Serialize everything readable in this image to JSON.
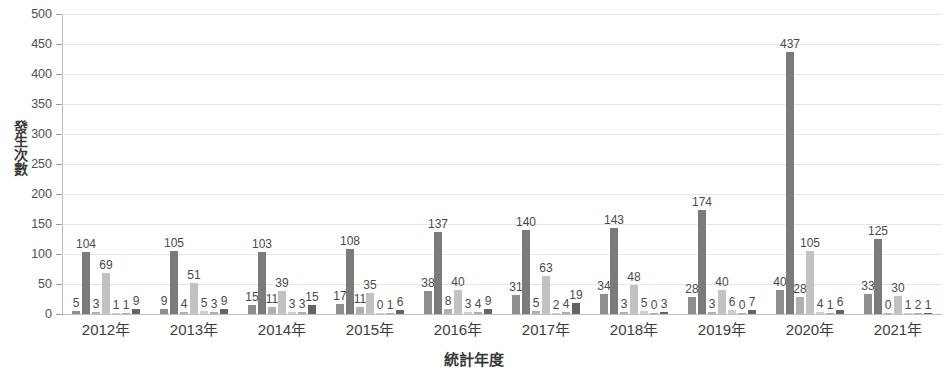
{
  "chart_data": {
    "type": "bar",
    "title": "",
    "xlabel": "統計年度",
    "ylabel": "發生次數",
    "ylim": [
      0,
      500
    ],
    "ytick_interval": 50,
    "yticks": [
      "0",
      "50",
      "100",
      "150",
      "200",
      "250",
      "300",
      "350",
      "400",
      "450",
      "500"
    ],
    "grid": true,
    "legend": "none",
    "categories": [
      "2012年",
      "2013年",
      "2014年",
      "2015年",
      "2016年",
      "2017年",
      "2018年",
      "2019年",
      "2020年",
      "2021年"
    ],
    "series": [
      {
        "name": "series-1",
        "color": "#8e8e8e",
        "values": [
          5,
          9,
          15,
          17,
          38,
          31,
          34,
          28,
          40,
          33
        ]
      },
      {
        "name": "series-2",
        "color": "#7b7b7b",
        "values": [
          104,
          105,
          103,
          108,
          137,
          140,
          143,
          174,
          437,
          125
        ]
      },
      {
        "name": "series-3",
        "color": "#b0b0b0",
        "values": [
          3,
          4,
          11,
          11,
          8,
          5,
          3,
          3,
          28,
          0
        ]
      },
      {
        "name": "series-4",
        "color": "#c2c2c2",
        "values": [
          69,
          51,
          39,
          35,
          40,
          63,
          48,
          40,
          105,
          30
        ]
      },
      {
        "name": "series-5",
        "color": "#d0d0d0",
        "values": [
          1,
          5,
          3,
          0,
          3,
          2,
          5,
          6,
          4,
          1
        ]
      },
      {
        "name": "series-6",
        "color": "#aeaeae",
        "values": [
          1,
          3,
          3,
          1,
          4,
          4,
          0,
          0,
          1,
          2
        ]
      },
      {
        "name": "series-7",
        "color": "#636363",
        "values": [
          9,
          9,
          15,
          6,
          9,
          19,
          3,
          7,
          6,
          1
        ]
      }
    ]
  },
  "colors": {
    "gridline": "#e6e6e6",
    "axis": "#bdbdbd",
    "text": "#404040"
  }
}
